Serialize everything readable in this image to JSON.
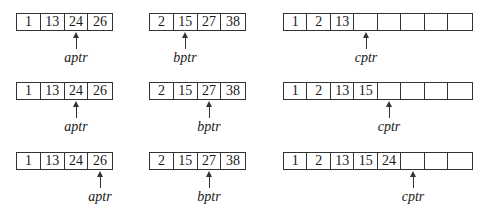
{
  "diagram": {
    "title": "",
    "steps": [
      {
        "a": {
          "values": [
            "1",
            "13",
            "24",
            "26"
          ],
          "pointer_index": 2,
          "pointer_label": "aptr"
        },
        "b": {
          "values": [
            "2",
            "15",
            "27",
            "38"
          ],
          "pointer_index": 1,
          "pointer_label": "bptr"
        },
        "c": {
          "values": [
            "1",
            "2",
            "13",
            "",
            "",
            "",
            "",
            ""
          ],
          "pointer_index": 3,
          "pointer_label": "cptr"
        }
      },
      {
        "a": {
          "values": [
            "1",
            "13",
            "24",
            "26"
          ],
          "pointer_index": 2,
          "pointer_label": "aptr"
        },
        "b": {
          "values": [
            "2",
            "15",
            "27",
            "38"
          ],
          "pointer_index": 2,
          "pointer_label": "bptr"
        },
        "c": {
          "values": [
            "1",
            "2",
            "13",
            "15",
            "",
            "",
            "",
            ""
          ],
          "pointer_index": 4,
          "pointer_label": "cptr"
        }
      },
      {
        "a": {
          "values": [
            "1",
            "13",
            "24",
            "26"
          ],
          "pointer_index": 3,
          "pointer_label": "aptr"
        },
        "b": {
          "values": [
            "2",
            "15",
            "27",
            "38"
          ],
          "pointer_index": 2,
          "pointer_label": "bptr"
        },
        "c": {
          "values": [
            "1",
            "2",
            "13",
            "15",
            "24",
            "",
            "",
            ""
          ],
          "pointer_index": 5,
          "pointer_label": "cptr"
        }
      }
    ]
  }
}
